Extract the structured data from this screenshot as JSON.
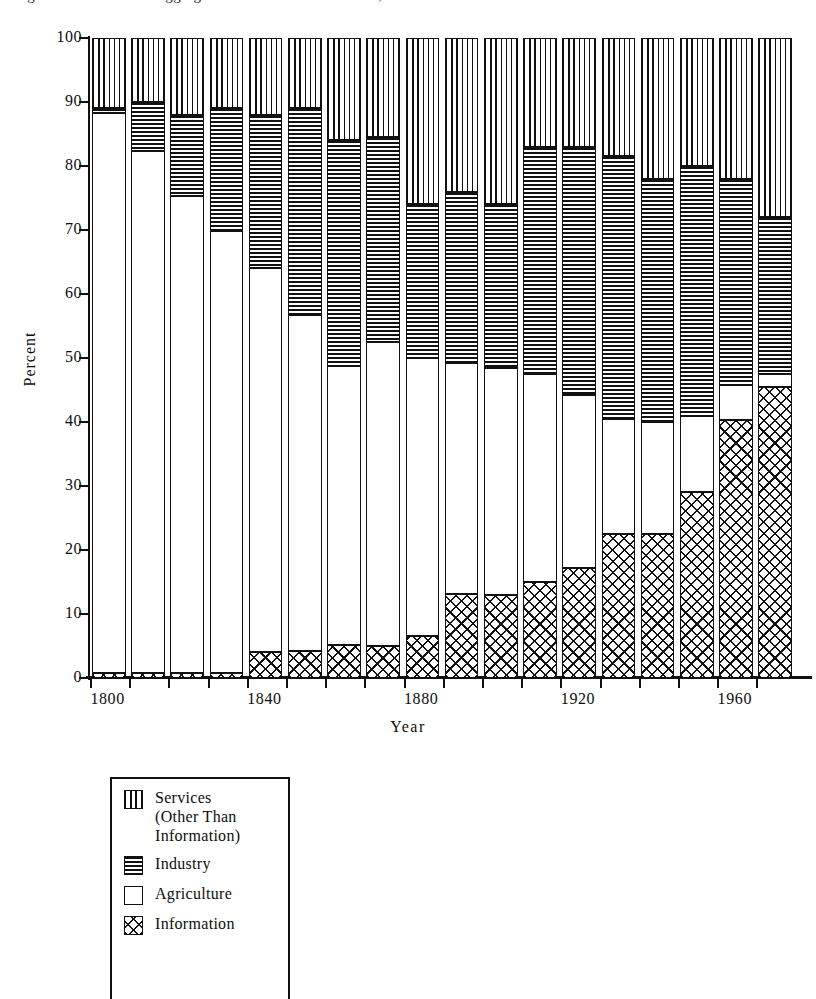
{
  "figure": {
    "title_clipped": "Figure 1.  Four Sector Aggregation of the U.S. Workforce, 1800-1980",
    "ylabel": "Percent",
    "xlabel": "Year"
  },
  "legend": {
    "items": [
      {
        "key": "services",
        "label_lines": [
          "Services",
          "(Other Than",
          "Information)"
        ],
        "pattern": "vertical-lines"
      },
      {
        "key": "industry",
        "label_lines": [
          "Industry"
        ],
        "pattern": "horizontal-lines"
      },
      {
        "key": "agriculture",
        "label_lines": [
          "Agriculture"
        ],
        "pattern": "solid-white"
      },
      {
        "key": "information",
        "label_lines": [
          "Information"
        ],
        "pattern": "cross-hatch"
      }
    ]
  },
  "chart_data": {
    "type": "bar",
    "stacked": true,
    "title": "Four Sector Aggregation of the U.S. Workforce, 1800-1980",
    "xlabel": "Year",
    "ylabel": "Percent",
    "ylim": [
      0,
      100
    ],
    "ytick_values": [
      0,
      10,
      20,
      30,
      40,
      50,
      60,
      70,
      80,
      90,
      100
    ],
    "xtick_labels": [
      "1800",
      "1840",
      "1880",
      "1920",
      "1960"
    ],
    "xtick_categories": [
      "1800",
      "1840",
      "1880",
      "1920",
      "1960"
    ],
    "grid": false,
    "legend_position": "below-left",
    "categories": [
      "1800",
      "1810",
      "1820",
      "1830",
      "1840",
      "1850",
      "1860",
      "1870",
      "1880",
      "1890",
      "1900",
      "1910",
      "1920",
      "1930",
      "1940",
      "1950",
      "1960",
      "1970"
    ],
    "series": [
      {
        "name": "Information",
        "pattern": "cross-hatch",
        "values": [
          0.8,
          0.8,
          0.8,
          0.8,
          4.0,
          4.2,
          5.2,
          5.0,
          6.5,
          13.2,
          13.0,
          15.0,
          17.2,
          22.5,
          22.5,
          29.0,
          40.3,
          45.5
        ]
      },
      {
        "name": "Agriculture",
        "pattern": "solid-white",
        "values": [
          87.5,
          81.5,
          74.5,
          69.0,
          60.0,
          52.5,
          43.5,
          47.5,
          43.5,
          36.0,
          35.5,
          32.5,
          27.0,
          18.0,
          17.5,
          12.0,
          5.5,
          2.0
        ]
      },
      {
        "name": "Industry",
        "pattern": "horizontal-lines",
        "values": [
          0.7,
          7.7,
          12.7,
          19.2,
          24.0,
          32.3,
          35.3,
          32.0,
          24.0,
          26.8,
          25.5,
          35.5,
          38.8,
          41.0,
          38.0,
          39.0,
          32.2,
          24.5
        ]
      },
      {
        "name": "Services (Other Than Information)",
        "pattern": "vertical-lines",
        "values": [
          11.0,
          10.0,
          12.0,
          11.0,
          12.0,
          11.0,
          16.0,
          15.5,
          26.0,
          24.0,
          26.0,
          17.0,
          17.0,
          18.5,
          22.0,
          20.0,
          22.0,
          28.0
        ]
      }
    ],
    "cumulative_tops": {
      "information": [
        0.8,
        0.8,
        0.8,
        0.8,
        4.0,
        4.2,
        5.2,
        5.0,
        6.5,
        13.2,
        13.0,
        15.0,
        17.2,
        22.5,
        22.5,
        29.0,
        40.3,
        45.5
      ],
      "agriculture": [
        88.3,
        82.3,
        75.3,
        69.8,
        64.0,
        56.7,
        48.7,
        52.5,
        50.0,
        49.2,
        48.5,
        47.5,
        44.2,
        40.5,
        40.0,
        41.0,
        45.8,
        47.5
      ],
      "industry": [
        89.0,
        90.0,
        88.0,
        89.0,
        88.0,
        89.0,
        84.0,
        84.5,
        74.0,
        76.0,
        74.0,
        83.0,
        83.0,
        81.5,
        78.0,
        80.0,
        78.0,
        72.0
      ],
      "services": [
        100,
        100,
        100,
        100,
        100,
        100,
        100,
        100,
        100,
        100,
        100,
        100,
        100,
        100,
        100,
        100,
        100,
        100
      ]
    }
  }
}
